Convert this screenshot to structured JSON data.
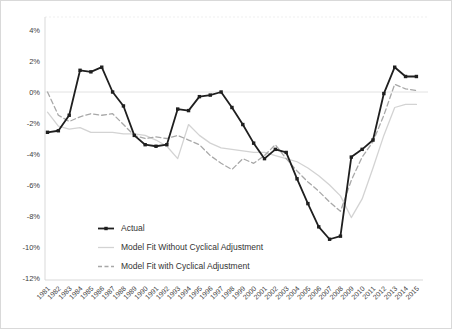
{
  "chart_data": {
    "type": "line",
    "title": "",
    "xlabel": "",
    "ylabel": "",
    "x": [
      1981,
      1982,
      1983,
      1984,
      1985,
      1986,
      1987,
      1988,
      1989,
      1990,
      1991,
      1992,
      1993,
      1994,
      1995,
      1996,
      1997,
      1998,
      1999,
      2000,
      2001,
      2002,
      2003,
      2004,
      2005,
      2006,
      2007,
      2008,
      2009,
      2010,
      2011,
      2012,
      2013,
      2014,
      2015
    ],
    "ylim": [
      -12,
      4
    ],
    "ytick_step": 2,
    "ytick_labels": [
      "4%",
      "2%",
      "0%",
      "-2%",
      "-4%",
      "-6%",
      "-8%",
      "-10%",
      "-12%"
    ],
    "grid": "zero-line-only",
    "legend_position": "inside-bottom-left",
    "axis_color": "#d9d9d9",
    "zero_line_color": "#e2e2e2",
    "tick_label_color": "#404040",
    "series": [
      {
        "name": "Actual",
        "color": "#1f1f1f",
        "line": "solid",
        "markers": true,
        "values": [
          -2.6,
          -2.5,
          -1.5,
          1.4,
          1.3,
          1.6,
          0.0,
          -0.9,
          -2.8,
          -3.4,
          -3.5,
          -3.4,
          -1.1,
          -1.2,
          -0.3,
          -0.2,
          0.0,
          -1.0,
          -2.1,
          -3.3,
          -4.3,
          -3.7,
          -3.9,
          -5.6,
          -7.2,
          -8.7,
          -9.5,
          -9.3,
          -4.2,
          -3.7,
          -3.1,
          -0.1,
          1.6,
          1.0,
          1.0
        ]
      },
      {
        "name": "Model Fit Without Cyclical Adjustment",
        "color": "#d3d3d3",
        "line": "solid",
        "markers": false,
        "values": [
          -1.3,
          -2.2,
          -2.4,
          -2.3,
          -2.6,
          -2.6,
          -2.6,
          -2.7,
          -2.7,
          -2.8,
          -3.1,
          -3.5,
          -4.3,
          -2.1,
          -2.8,
          -3.3,
          -3.6,
          -3.7,
          -3.8,
          -3.9,
          -3.9,
          -4.1,
          -4.3,
          -4.5,
          -4.9,
          -5.4,
          -6.0,
          -6.7,
          -8.1,
          -6.9,
          -4.9,
          -2.8,
          -1.0,
          -0.8,
          -0.8
        ]
      },
      {
        "name": "Model Fit with Cyclical Adjustment",
        "color": "#a8a8a8",
        "line": "dashed",
        "markers": false,
        "values": [
          0.0,
          -1.5,
          -1.9,
          -1.6,
          -1.4,
          -1.5,
          -1.4,
          -2.1,
          -2.8,
          -3.0,
          -2.9,
          -3.0,
          -2.8,
          -3.1,
          -3.4,
          -4.1,
          -4.6,
          -5.0,
          -4.3,
          -4.6,
          -4.1,
          -3.4,
          -4.3,
          -5.1,
          -5.8,
          -6.4,
          -7.1,
          -7.7,
          -5.7,
          -4.2,
          -3.2,
          -1.5,
          0.5,
          0.2,
          0.1
        ]
      }
    ]
  }
}
